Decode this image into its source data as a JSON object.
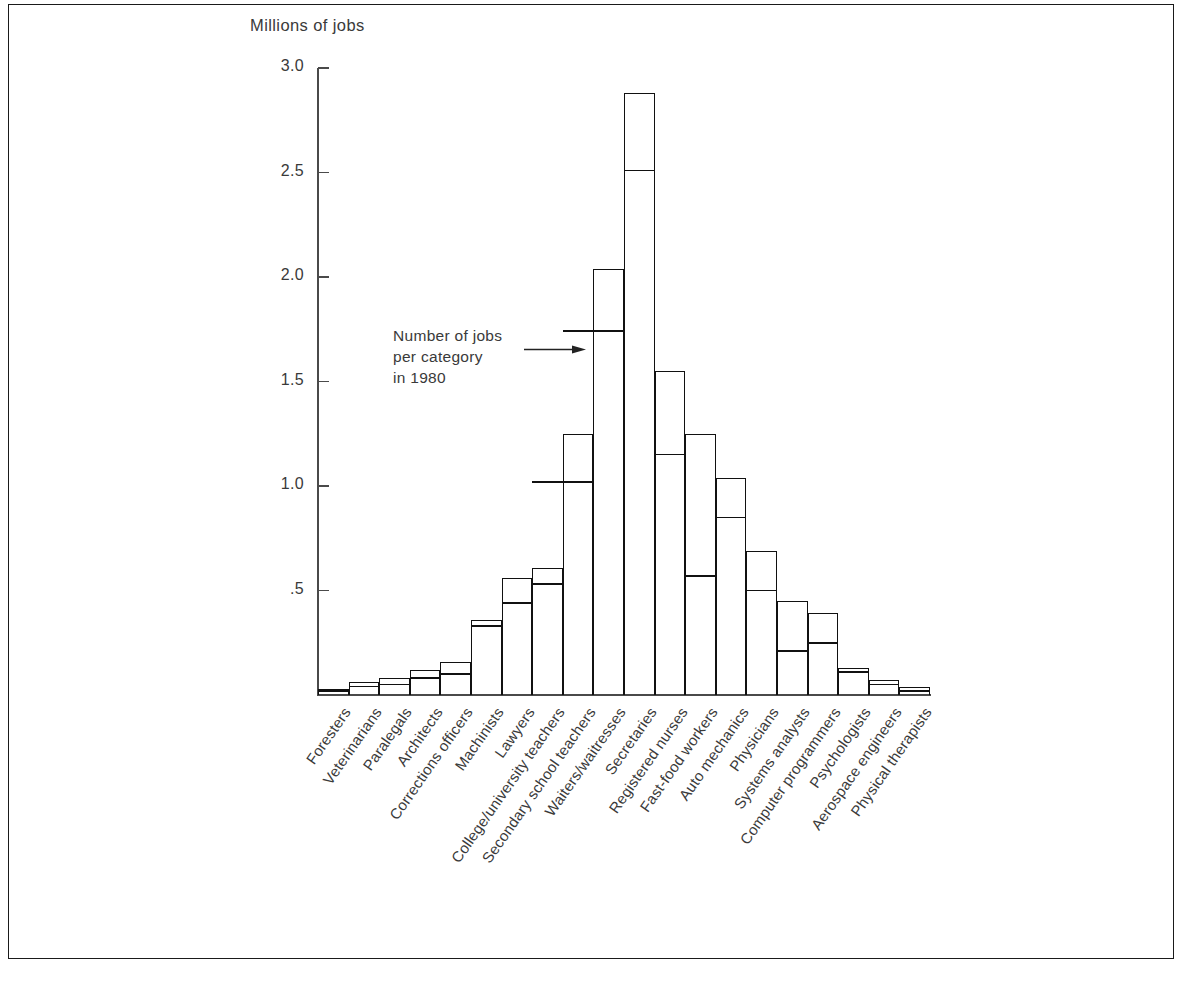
{
  "chart_data": {
    "type": "bar",
    "title": "Millions of jobs",
    "ylabel": "Millions of jobs",
    "xlabel": "",
    "ylim": [
      0,
      3.0
    ],
    "ytick_labels": [
      "3.0",
      "2.5",
      "2.0",
      "1.5",
      "1.0",
      ".5"
    ],
    "ytick_values": [
      3.0,
      2.5,
      2.0,
      1.5,
      1.0,
      0.5
    ],
    "grid": false,
    "legend_position": "none",
    "annotation": {
      "line1": "Number of jobs",
      "line2": "per category",
      "line3": "in 1980",
      "points_to_category": "Waiters/waitresses",
      "points_to_value": 1.74
    },
    "categories": [
      "Foresters",
      "Veterinarians",
      "Paralegals",
      "Architects",
      "Corrections officers",
      "Machinists",
      "Lawyers",
      "College/university teachers",
      "Secondary school teachers",
      "Waiters/waitresses",
      "Secretaries",
      "Registered nurses",
      "Fast-food workers",
      "Auto mechanics",
      "Physicians",
      "Systems analysts",
      "Computer programmers",
      "Psychologists",
      "Aerospace engineers",
      "Physical therapists"
    ],
    "series": [
      {
        "name": "Number of jobs per category in 1980",
        "values": [
          0.02,
          0.04,
          0.05,
          0.08,
          0.1,
          0.33,
          0.44,
          0.53,
          1.02,
          1.74,
          2.51,
          1.15,
          0.57,
          0.85,
          0.5,
          0.21,
          0.25,
          0.11,
          0.05,
          0.02
        ]
      },
      {
        "name": "Projected number of jobs per category in 1990",
        "values": [
          0.03,
          0.06,
          0.08,
          0.12,
          0.16,
          0.36,
          0.56,
          0.61,
          1.25,
          2.04,
          2.88,
          1.55,
          1.25,
          1.04,
          0.69,
          0.45,
          0.39,
          0.13,
          0.07,
          0.04
        ]
      }
    ],
    "inner_stub_categories": [
      "Secondary school teachers",
      "Waiters/waitresses"
    ],
    "axis_color": "#4a4a4a",
    "bar_line_color": "#111111",
    "background_color": "#ffffff"
  }
}
